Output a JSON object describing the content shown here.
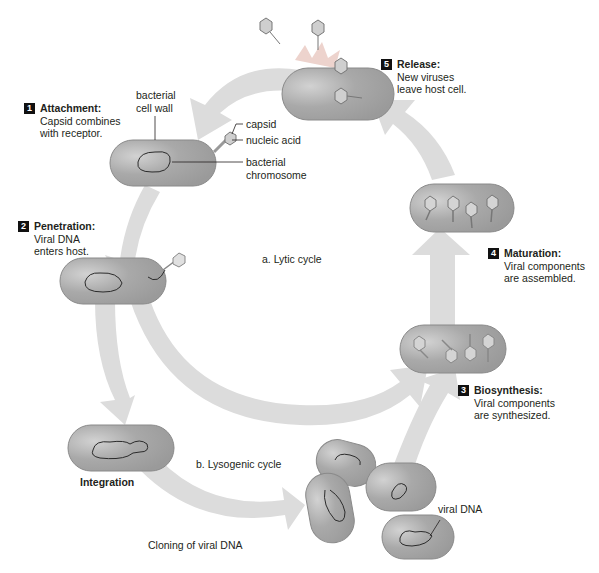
{
  "steps": [
    {
      "number": "1",
      "title": "Attachment:",
      "line1": "Capsid combines",
      "line2": "with receptor."
    },
    {
      "number": "2",
      "title": "Penetration:",
      "line1": "Viral DNA",
      "line2": "enters host."
    },
    {
      "number": "3",
      "title": "Biosynthesis:",
      "line1": "Viral components",
      "line2": "are synthesized."
    },
    {
      "number": "4",
      "title": "Maturation:",
      "line1": "Viral components",
      "line2": "are assembled."
    },
    {
      "number": "5",
      "title": "Release:",
      "line1": "New viruses",
      "line2": "leave host cell."
    }
  ],
  "labels": {
    "cell_wall_1": "bacterial",
    "cell_wall_2": "cell wall",
    "capsid": "capsid",
    "nucleic_acid": "nucleic acid",
    "chromosome_1": "bacterial",
    "chromosome_2": "chromosome",
    "lytic": "a. Lytic cycle",
    "lysogenic": "b. Lysogenic cycle",
    "integration": "Integration",
    "cloning": "Cloning of viral DNA",
    "viral_dna": "viral DNA"
  },
  "colors": {
    "arrow": "#d9d9d9",
    "cell": "#a9a9a9",
    "cell_border": "#8a8a8a",
    "text": "#231f20",
    "badge": "#111111"
  }
}
